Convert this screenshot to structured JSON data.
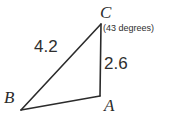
{
  "figure": {
    "type": "triangle-diagram",
    "background_color": "#ffffff",
    "stroke_color": "#2b2b2b",
    "text_color": "#2e2e2e",
    "stroke_width": 1.6,
    "vertices": [
      {
        "name": "C",
        "label": "C",
        "x": 101,
        "y": 24
      },
      {
        "name": "A",
        "label": "A",
        "x": 100,
        "y": 96
      },
      {
        "name": "B",
        "label": "B",
        "x": 21,
        "y": 110
      }
    ],
    "edges": [
      {
        "name": "BC",
        "from": "B",
        "to": "C",
        "label": "4.2"
      },
      {
        "name": "CA",
        "from": "C",
        "to": "A",
        "label": "2.6"
      },
      {
        "name": "AB",
        "from": "A",
        "to": "B",
        "label": ""
      }
    ],
    "labels": {
      "vertex_C": "C",
      "vertex_B": "B",
      "vertex_A": "A",
      "side_BC": "4.2",
      "side_CA": "2.6",
      "angle_at_C": "(43 degrees)"
    },
    "measurements": {
      "side_BC_length": 4.2,
      "side_CA_length": 2.6,
      "angle_C_degrees": 43
    }
  }
}
